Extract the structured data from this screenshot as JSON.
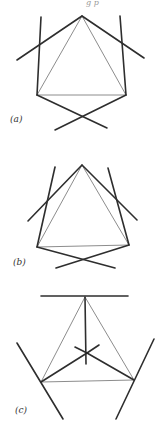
{
  "header_fragment": "g      p",
  "figures": [
    {
      "id": "a",
      "label": "(a)",
      "description": "Triangle with two crossing extended lines at top vertex, two near-vertical lines at sides, and a crossing pair below"
    },
    {
      "id": "b",
      "label": "(b)",
      "description": "Narrower variant of (a) with side lines converging upward"
    },
    {
      "id": "c",
      "label": "(c)",
      "description": "Triangle with horizontal bar at top vertex, radial lines from center, and slanted lines at base vertices"
    }
  ]
}
